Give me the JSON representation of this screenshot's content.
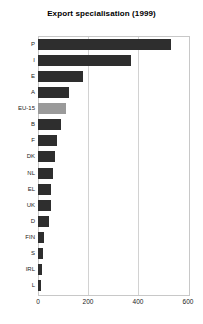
{
  "chart_data": {
    "type": "bar",
    "orientation": "horizontal",
    "title": "Export specialisation (1999)",
    "xlabel": "",
    "ylabel": "",
    "xlim": [
      0,
      600
    ],
    "xticks": [
      0,
      200,
      400,
      600
    ],
    "xtick_labels": [
      "0",
      "200",
      "400",
      "600"
    ],
    "grid": true,
    "legend": null,
    "categories": [
      "P",
      "I",
      "E",
      "A",
      "EU-15",
      "B",
      "F",
      "DK",
      "NL",
      "EL",
      "UK",
      "D",
      "FIN",
      "S",
      "IRL",
      "L"
    ],
    "values": [
      532,
      372,
      181,
      123,
      112,
      93,
      77,
      69,
      59,
      53,
      51,
      43,
      24,
      21,
      16,
      11
    ],
    "bar_colors": [
      "#2e2e2e",
      "#2e2e2e",
      "#2e2e2e",
      "#2e2e2e",
      "#9a9a9a",
      "#2e2e2e",
      "#2e2e2e",
      "#2e2e2e",
      "#2e2e2e",
      "#2e2e2e",
      "#2e2e2e",
      "#2e2e2e",
      "#2e2e2e",
      "#2e2e2e",
      "#2e2e2e",
      "#2e2e2e"
    ],
    "highlight_category": "EU-15",
    "colors": {
      "bar_default": "#2e2e2e",
      "bar_highlight": "#9a9a9a",
      "gridline": "#d2d2d2",
      "frame": "#c8c8c8",
      "background": "#ffffff",
      "text": "#1a1a1a"
    }
  }
}
